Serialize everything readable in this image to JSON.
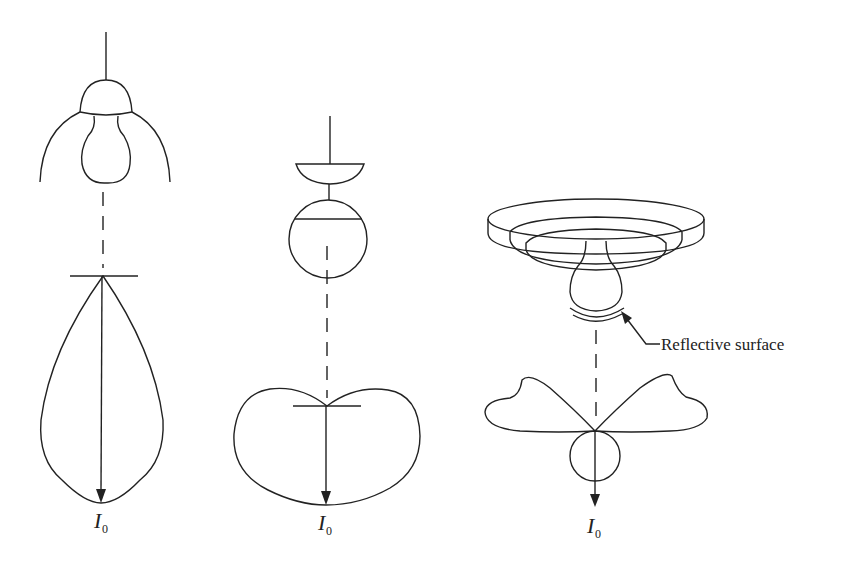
{
  "figure": {
    "type": "luminaire intensity distribution diagrams",
    "panels": [
      {
        "id": "direct",
        "description": "Pendant lamp with dome reflector; narrow downward teardrop distribution",
        "intensity_label": {
          "main": "I",
          "sub": "0"
        }
      },
      {
        "id": "diffuse",
        "description": "Pendant globe lamp with shallow cap; broad heart-shaped distribution",
        "intensity_label": {
          "main": "I",
          "sub": "0"
        }
      },
      {
        "id": "indirect",
        "description": "Recessed ceiling fixture with reflective surface under bulb; batwing upward lobes with small downward circle",
        "intensity_label": {
          "main": "I",
          "sub": "0"
        },
        "callout": "Reflective surface"
      }
    ]
  }
}
